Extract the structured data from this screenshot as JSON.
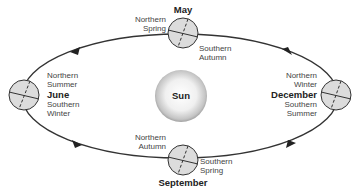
{
  "diagram": {
    "sun": {
      "label": "Sun"
    },
    "positions": [
      {
        "id": "may",
        "month": "May",
        "north": "Northern\nSpring",
        "north_l1": "Northern",
        "north_l2": "Spring",
        "south_l1": "Southern",
        "south_l2": "Autumn"
      },
      {
        "id": "june",
        "month": "June",
        "north_l1": "Northern",
        "north_l2": "Summer",
        "south_l1": "Southern",
        "south_l2": "Winter"
      },
      {
        "id": "december",
        "month": "December",
        "north_l1": "Northern",
        "north_l2": "Winter",
        "south_l1": "Southern",
        "south_l2": "Summer"
      },
      {
        "id": "september",
        "month": "September",
        "north_l1": "Northern",
        "north_l2": "Autumn",
        "south_l1": "Southern",
        "south_l2": "Spring"
      }
    ],
    "colors": {
      "orbit": "#333333",
      "earth_fill": "#dcdcdc",
      "sun_center": "#ffffff",
      "sun_edge": "#9a9a9a"
    }
  }
}
